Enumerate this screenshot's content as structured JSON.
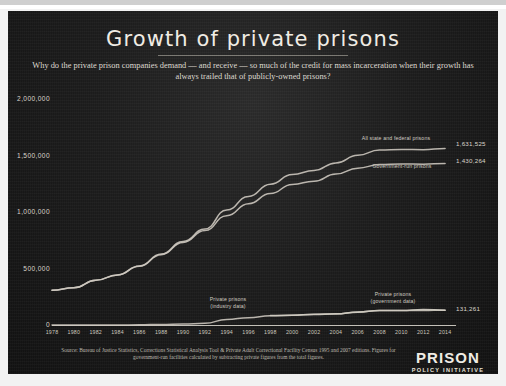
{
  "poster": {
    "title": "Growth of private prisons",
    "subtitle": "Why do the private prison companies demand — and receive — so much of the credit for mass incarceration when their growth has always trailed that of publicly-owned prisons?",
    "source": "Source: Bureau of Justice Statistics, Corrections Statistical Analysis Tool & Private Adult Correctional Facility Census 1995 and 2007 editions. Figures for government-run facilities calculated by subtracting private figures from the total figures.",
    "logo_line1": "PRISON",
    "logo_line2": "POLICY INITIATIVE",
    "background_color": "#1c1c1c",
    "text_color": "#f0ece4"
  },
  "chart_data": {
    "type": "line",
    "title": "Growth of private prisons",
    "subtitle": "Why do the private prison companies demand — and receive — so much of the credit for mass incarceration when their growth has always trailed that of publicly-owned prisons?",
    "xlabel": "",
    "ylabel": "",
    "grid": false,
    "legend": "inline-annotations",
    "xlim": [
      1978,
      2015
    ],
    "ylim": [
      0,
      2000000
    ],
    "x_ticks": [
      1978,
      1980,
      1982,
      1984,
      1986,
      1988,
      1990,
      1992,
      1994,
      1996,
      1998,
      2000,
      2002,
      2004,
      2006,
      2008,
      2010,
      2012,
      2014
    ],
    "y_ticks": [
      0,
      500000,
      1000000,
      1500000,
      2000000
    ],
    "y_tick_labels": [
      "0",
      "500,000",
      "1,000,000",
      "1,500,000",
      "2,000,000"
    ],
    "x": [
      1978,
      1980,
      1982,
      1984,
      1986,
      1988,
      1990,
      1992,
      1994,
      1996,
      1998,
      2000,
      2002,
      2004,
      2006,
      2008,
      2010,
      2012,
      2014
    ],
    "series": [
      {
        "name": "All state and federal prisons",
        "label": "All state and federal prisons",
        "color": "#cfcac0",
        "end_value_label": "1,631,525",
        "end_value": 1631525,
        "values": [
          307276,
          329821,
          395516,
          443398,
          522084,
          627402,
          739980,
          850566,
          1016691,
          1137722,
          1245402,
          1331278,
          1367856,
          1433793,
          1502179,
          1547742,
          1552669,
          1551537,
          1561525
        ]
      },
      {
        "name": "Government-run prisons",
        "label": "Government-run prisons",
        "color": "#cfcac0",
        "end_value_label": "1,430,264",
        "end_value": 1430264,
        "values": [
          307276,
          329821,
          395516,
          443398,
          520084,
          622402,
          730980,
          835566,
          967691,
          1072722,
          1163402,
          1244278,
          1271856,
          1335793,
          1388179,
          1419742,
          1424669,
          1423537,
          1430264
        ]
      },
      {
        "name": "Private prisons (industry data)",
        "label": "Private prisons\n(industry data)",
        "color": "#cfcac0",
        "values": [
          0,
          0,
          0,
          0,
          2000,
          5000,
          9000,
          15000,
          49000,
          65000,
          82000,
          87000,
          96000,
          98000,
          114000,
          128000,
          128000,
          128000,
          131261
        ]
      },
      {
        "name": "Private prisons (government data)",
        "label": "Private prisons\n(government data)",
        "color": "#cfcac0",
        "end_value_label": "131,261",
        "end_value": 131261,
        "values": [
          null,
          null,
          null,
          null,
          null,
          null,
          null,
          null,
          null,
          null,
          83000,
          87000,
          93771,
          98628,
          113791,
          128524,
          128195,
          137220,
          131261
        ]
      }
    ],
    "annotations": [
      {
        "text": "All state and federal prisons",
        "near_year": 2006
      },
      {
        "text": "Government-run prisons",
        "near_year": 2007
      },
      {
        "text": "Private prisons (industry data)",
        "near_year": 1997
      },
      {
        "text": "Private prisons (government data)",
        "near_year": 2008
      }
    ]
  }
}
